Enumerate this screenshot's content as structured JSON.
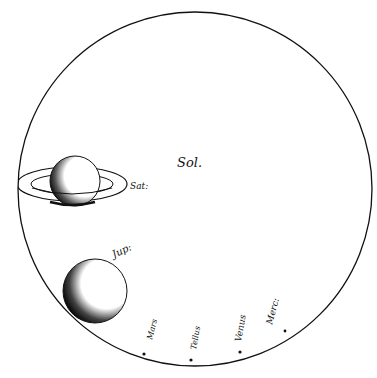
{
  "diagram": {
    "labels": {
      "sun": "Sol.",
      "saturn": "Sat:",
      "jupiter": "Jup:",
      "mars": "Mars",
      "earth": "Tellus",
      "venus": "Venus",
      "mercury": "Merc:"
    },
    "colors": {
      "ink": "#111111",
      "paper": "#ffffff"
    }
  }
}
